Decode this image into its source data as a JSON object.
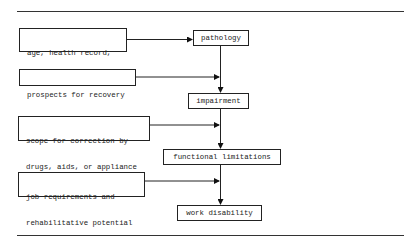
{
  "diagram": {
    "type": "flowchart",
    "main_chain": [
      {
        "id": "pathology",
        "label": "pathology"
      },
      {
        "id": "impairment",
        "label": "impairment"
      },
      {
        "id": "functional",
        "label": "functional limitations"
      },
      {
        "id": "work",
        "label": "work disability"
      }
    ],
    "factors": [
      {
        "id": "f1",
        "lines": [
          "age, health record,",
          "occupational hazards"
        ],
        "target": "pathology"
      },
      {
        "id": "f2",
        "lines": [
          "prospects for recovery"
        ],
        "target": "pathology-impairment link"
      },
      {
        "id": "f3",
        "lines": [
          "scope for correction by",
          "drugs, aids, or appliance"
        ],
        "target": "impairment-functional link"
      },
      {
        "id": "f4",
        "lines": [
          "job requirements and",
          "rehabilitative potential"
        ],
        "target": "functional-work link"
      }
    ]
  }
}
